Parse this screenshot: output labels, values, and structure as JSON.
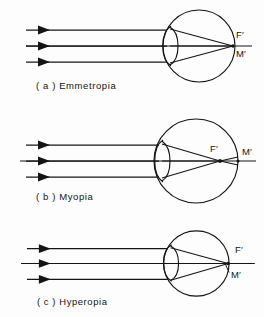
{
  "figure": {
    "background_color": "#fdfdfd",
    "ink_color": "#141414",
    "width": 264,
    "height": 317
  },
  "panels": [
    {
      "id": "a",
      "caption": "( a )  Emmetropia",
      "caption_letter": "( a )",
      "caption_name": "Emmetropia",
      "labels": {
        "focal_point": "F′",
        "macula_point": "M′"
      },
      "ray_count": 3,
      "description": "Parallel rays focus exactly on the retina; F′ and M′ coincide at the back of the eye",
      "eye": {
        "cx": 199,
        "cy": 46,
        "rx": 36,
        "ry": 36
      },
      "focus_x": 233,
      "retina_x": 233,
      "f_label_pos": {
        "x": 236,
        "y": 38
      },
      "m_label_pos": {
        "x": 236,
        "y": 57
      }
    },
    {
      "id": "b",
      "caption": "( b )  Myopia",
      "caption_letter": "( b )",
      "caption_name": "Myopia",
      "labels": {
        "focal_point": "F′",
        "macula_point": "M′"
      },
      "ray_count": 3,
      "description": "Eye is elongated; parallel rays focus in front of the retina, F′ lies inside the globe ahead of M′",
      "eye": {
        "cx": 196,
        "cy": 56,
        "rx": 42,
        "ry": 42
      },
      "focus_x": 220,
      "retina_x": 238,
      "f_label_pos": {
        "x": 214,
        "y": 48
      },
      "m_label_pos": {
        "x": 242,
        "y": 50
      }
    },
    {
      "id": "c",
      "caption": "( c )  Hyperopia",
      "caption_letter": "( c )",
      "caption_name": "Hyperopia",
      "labels": {
        "focal_point": "F′",
        "macula_point": "M′"
      },
      "ray_count": 3,
      "description": "Eye is shortened; parallel rays would focus behind the retina, F′ lies beyond the globe past M′",
      "eye": {
        "cx": 197,
        "cy": 53,
        "rx": 33,
        "ry": 33
      },
      "focus_x": 229,
      "retina_x": 229,
      "f_label_pos": {
        "x": 236,
        "y": 42
      },
      "m_label_pos": {
        "x": 232,
        "y": 66
      }
    }
  ],
  "rays": {
    "start_x": 26,
    "arrow_x": 47,
    "label": "incident parallel rays"
  }
}
